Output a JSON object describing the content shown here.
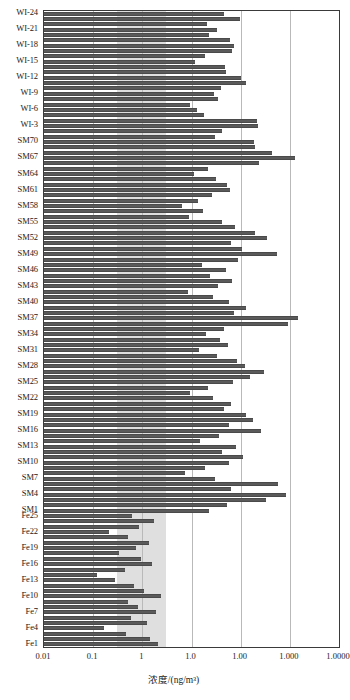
{
  "chart_data": {
    "type": "bar",
    "orientation": "horizontal",
    "title": "",
    "xlabel": "浓度/(ng/m³)",
    "ylabel": "",
    "xscale": "log",
    "xlim": [
      0.01,
      10000
    ],
    "grid": true,
    "legend": null,
    "xticks": [
      0.01,
      0.1,
      1,
      10,
      100,
      1000,
      10000
    ],
    "xticklabels": [
      "0.01",
      "0.1",
      "1",
      "1.0",
      "1.00",
      "1.000",
      "1.0000"
    ],
    "shaded_band": {
      "from": 0.3,
      "to": 3.0,
      "color": "#d9d9d9"
    },
    "bar_color": "#5a5a5a",
    "categories": [
      "WI-24",
      "WI-23",
      "WI-22",
      "WI-21",
      "WI-20",
      "WI-19",
      "WI-18",
      "WI-17",
      "WI-16",
      "WI-15",
      "WI-14",
      "WI-13",
      "WI-12",
      "WI-11",
      "WI-10",
      "WI-9",
      "WI-8",
      "WI-7",
      "WI-6",
      "WI-5",
      "WI-4",
      "WI-3",
      "WI-2",
      "WI-1",
      "SM70",
      "SM69",
      "SM68",
      "SM67",
      "SM66",
      "SM65",
      "SM64",
      "SM63",
      "SM62",
      "SM61",
      "SM60",
      "SM59",
      "SM58",
      "SM57",
      "SM56",
      "SM55",
      "SM54",
      "SM53",
      "SM52",
      "SM51",
      "SM50",
      "SM49",
      "SM48",
      "SM47",
      "SM46",
      "SM45",
      "SM44",
      "SM43",
      "SM42",
      "SM41",
      "SM40",
      "SM39",
      "SM38",
      "SM37",
      "SM36",
      "SM35",
      "SM34",
      "SM33",
      "SM32",
      "SM31",
      "SM30",
      "SM29",
      "SM28",
      "SM27",
      "SM26",
      "SM25",
      "SM24",
      "SM23",
      "SM22",
      "SM21",
      "SM20",
      "SM19",
      "SM18",
      "SM17",
      "SM16",
      "SM15",
      "SM14",
      "SM13",
      "SM12",
      "SM11",
      "SM10",
      "SM9",
      "SM8",
      "SM7",
      "SM6",
      "SM5",
      "SM4",
      "SM3",
      "SM2",
      "SM1",
      "Fe25",
      "Fe24",
      "Fe23",
      "Fe22",
      "Fe21",
      "Fe20",
      "Fe19",
      "Fe18",
      "Fe17",
      "Fe16",
      "Fe15",
      "Fe14",
      "Fe13",
      "Fe12",
      "Fe11",
      "Fe10",
      "Fe9",
      "Fe8",
      "Fe7",
      "Fe6",
      "Fe5",
      "Fe4",
      "Fe3",
      "Fe2",
      "Fe1"
    ],
    "tick_labels_shown": [
      "WI-24",
      "WI-21",
      "WI-18",
      "WI-15",
      "WI-12",
      "WI-9",
      "WI-6",
      "WI-3",
      "SM70",
      "SM67",
      "SM64",
      "SM61",
      "SM58",
      "SM55",
      "SM52",
      "SM49",
      "SM46",
      "SM43",
      "SM40",
      "SM37",
      "SM34",
      "SM31",
      "SM28",
      "SM25",
      "SM22",
      "SM19",
      "SM16",
      "SM13",
      "SM10",
      "SM7",
      "SM4",
      "SM1",
      "Fe25",
      "Fe22",
      "Fe19",
      "Fe16",
      "Fe13",
      "Fe10",
      "Fe7",
      "Fe4",
      "Fe1"
    ],
    "values": [
      46,
      95,
      21,
      33,
      23,
      60,
      72,
      68,
      19,
      12,
      48,
      51,
      100,
      130,
      40,
      29,
      35,
      9.5,
      13,
      18,
      210,
      230,
      42,
      30,
      185,
      195,
      430,
      1300,
      240,
      22,
      11.5,
      31,
      53,
      62,
      26,
      13.5,
      6.5,
      17,
      9,
      41,
      77,
      200,
      340,
      64,
      105,
      560,
      88,
      16,
      50,
      24,
      68,
      35,
      8.5,
      27,
      59,
      130,
      74,
      1500,
      900,
      45,
      20,
      38,
      56,
      14,
      33,
      86,
      120,
      300,
      155,
      71,
      22,
      9.5,
      28,
      64,
      46,
      130,
      175,
      58,
      260,
      36,
      15,
      80,
      42,
      110,
      57,
      19,
      7.5,
      30,
      580,
      63,
      850,
      330,
      52,
      23,
      0.62,
      1.7,
      0.85,
      0.21,
      0.52,
      1.35,
      0.73,
      0.33,
      0.95,
      1.55,
      0.44,
      0.12,
      0.28,
      0.68,
      1.1,
      2.4,
      0.5,
      0.82,
      1.9,
      0.6,
      1.25,
      0.17,
      0.47,
      1.45,
      2.1
    ]
  }
}
